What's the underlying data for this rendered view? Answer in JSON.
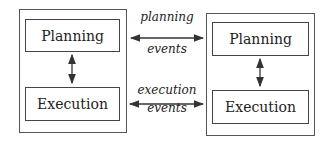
{
  "diagram": {
    "left_agent": {
      "planning_label": "Planning",
      "execution_label": "Execution"
    },
    "right_agent": {
      "planning_label": "Planning",
      "execution_label": "Execution"
    },
    "connections": {
      "planning_top": "planning",
      "planning_bottom": "events",
      "execution_top": "execution",
      "execution_bottom": "events"
    },
    "colors": {
      "line": "#444444",
      "background": "#ffffff"
    }
  }
}
